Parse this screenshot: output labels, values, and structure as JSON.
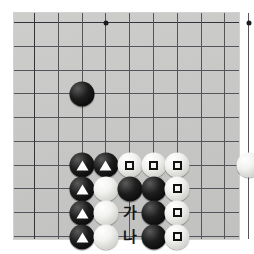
{
  "diagram": {
    "kind": "go-board-problem-diagram",
    "title": "",
    "board": {
      "background_color": "#c8c8c6",
      "line_color": "#54545a",
      "columns": 10,
      "rows": 10,
      "star_points": [
        {
          "col": 3,
          "row": 0
        },
        {
          "col": 9,
          "row": 0
        }
      ]
    },
    "colors": {
      "black_stone": "#000000",
      "white_stone": "#f2f2f0",
      "triangle_mark": "#ffffff",
      "square_mark": "#121212",
      "label_text": "#161616"
    },
    "stones": [
      {
        "id": "b-upper-left",
        "color": "black",
        "col": 2,
        "row": 3,
        "mark": "none"
      },
      {
        "id": "b-r6-c2",
        "color": "black",
        "col": 2,
        "row": 6,
        "mark": "triangle"
      },
      {
        "id": "b-r6-c3",
        "color": "black",
        "col": 3,
        "row": 6,
        "mark": "triangle"
      },
      {
        "id": "w-r6-c4",
        "color": "white",
        "col": 4,
        "row": 6,
        "mark": "square"
      },
      {
        "id": "w-r6-c5",
        "color": "white",
        "col": 5,
        "row": 6,
        "mark": "square"
      },
      {
        "id": "w-r6-c6",
        "color": "white",
        "col": 6,
        "row": 6,
        "mark": "square"
      },
      {
        "id": "b-r7-c2",
        "color": "black",
        "col": 2,
        "row": 7,
        "mark": "triangle"
      },
      {
        "id": "w-r7-c3",
        "color": "white",
        "col": 3,
        "row": 7,
        "mark": "none"
      },
      {
        "id": "b-r7-c4",
        "color": "black",
        "col": 4,
        "row": 7,
        "mark": "none"
      },
      {
        "id": "b-r7-c5",
        "color": "black",
        "col": 5,
        "row": 7,
        "mark": "none"
      },
      {
        "id": "w-r7-c6",
        "color": "white",
        "col": 6,
        "row": 7,
        "mark": "square"
      },
      {
        "id": "b-r8-c2",
        "color": "black",
        "col": 2,
        "row": 8,
        "mark": "triangle"
      },
      {
        "id": "w-r8-c3",
        "color": "white",
        "col": 3,
        "row": 8,
        "mark": "none"
      },
      {
        "id": "b-r8-c5",
        "color": "black",
        "col": 5,
        "row": 8,
        "mark": "none"
      },
      {
        "id": "w-r8-c6",
        "color": "white",
        "col": 6,
        "row": 8,
        "mark": "square"
      },
      {
        "id": "b-r9-c2",
        "color": "black",
        "col": 2,
        "row": 9,
        "mark": "triangle"
      },
      {
        "id": "w-r9-c3",
        "color": "white",
        "col": 3,
        "row": 9,
        "mark": "none"
      },
      {
        "id": "b-r9-c5",
        "color": "black",
        "col": 5,
        "row": 9,
        "mark": "none"
      },
      {
        "id": "w-r9-c6",
        "color": "white",
        "col": 6,
        "row": 9,
        "mark": "square"
      },
      {
        "id": "w-right-edge",
        "color": "white",
        "col": 9,
        "row": 6,
        "mark": "none"
      }
    ],
    "point_labels": [
      {
        "id": "label-ga",
        "text": "가",
        "col": 4,
        "row": 8
      },
      {
        "id": "label-na",
        "text": "나",
        "col": 4,
        "row": 9
      }
    ]
  }
}
